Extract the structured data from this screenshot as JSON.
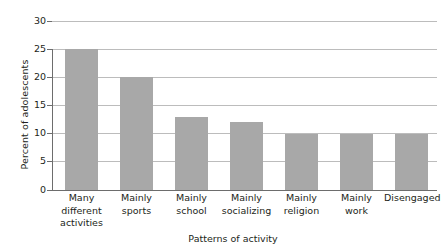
{
  "chart_data": {
    "type": "bar",
    "title": "",
    "xlabel": "Patterns of activity",
    "ylabel": "Percent of adolescents",
    "categories": [
      "Many different activities",
      "Mainly sports",
      "Mainly school",
      "Mainly socializing",
      "Mainly religion",
      "Mainly work",
      "Disengaged"
    ],
    "category_lines": [
      [
        "Many",
        "different",
        "activities"
      ],
      [
        "Mainly",
        "sports"
      ],
      [
        "Mainly",
        "school"
      ],
      [
        "Mainly",
        "socializing"
      ],
      [
        "Mainly",
        "religion"
      ],
      [
        "Mainly",
        "work"
      ],
      [
        "Disengaged"
      ]
    ],
    "values": [
      25,
      20,
      13,
      12,
      10,
      10,
      10
    ],
    "ylim": [
      0,
      30
    ],
    "yticks": [
      0,
      5,
      10,
      15,
      20,
      25,
      30
    ],
    "ytick_labels": [
      "0",
      "5",
      "10",
      "15",
      "20",
      "25",
      "30"
    ],
    "grid": true,
    "legend": "none",
    "bar_color": "#a8a8a8",
    "gridline_color": "#bcbcbc",
    "axis_color": "#6d6d6d",
    "text_color": "#231f20",
    "background": "#ffffff"
  }
}
